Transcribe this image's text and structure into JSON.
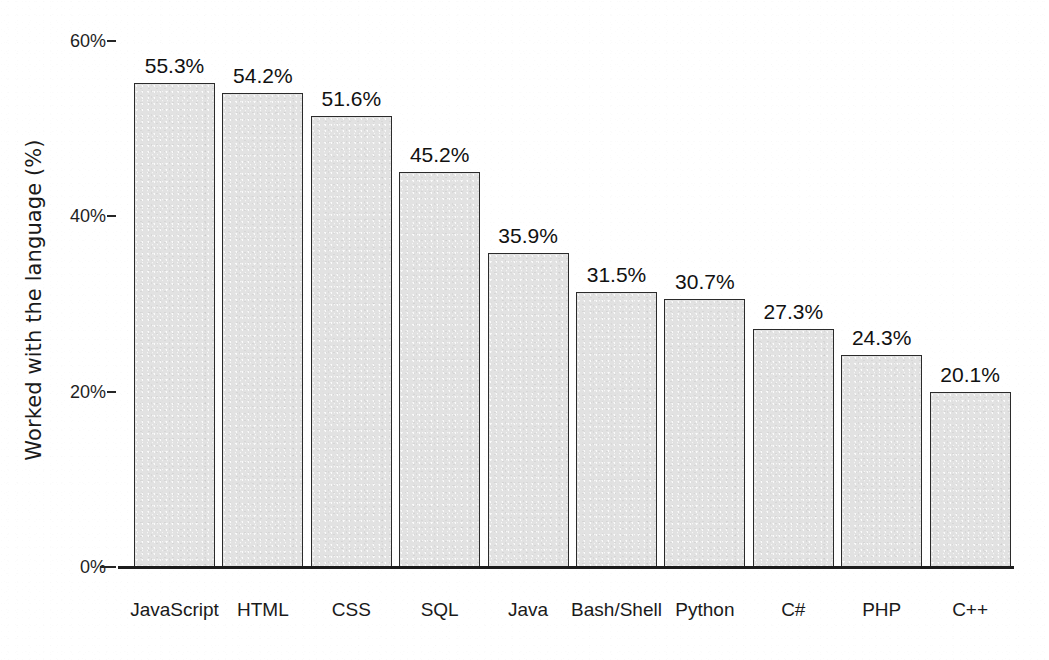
{
  "chart_data": {
    "type": "bar",
    "title": "",
    "xlabel": "",
    "ylabel": "Worked with the language (%)",
    "ylim": [
      0,
      60
    ],
    "grid": false,
    "legend": false,
    "orientation": "vertical",
    "categories": [
      "JavaScript",
      "HTML",
      "CSS",
      "SQL",
      "Java",
      "Bash/Shell",
      "Python",
      "C#",
      "PHP",
      "C++"
    ],
    "values": [
      55.3,
      54.2,
      51.6,
      45.2,
      35.9,
      31.5,
      30.7,
      27.3,
      24.3,
      20.1
    ],
    "value_labels": [
      "55.3%",
      "54.2%",
      "51.6%",
      "45.2%",
      "35.9%",
      "31.5%",
      "30.7%",
      "27.3%",
      "24.3%",
      "20.1%"
    ],
    "y_ticks": [
      0,
      20,
      40,
      60
    ],
    "y_tick_labels": [
      "0%",
      "20%",
      "40%",
      "60%"
    ],
    "bar_fill_color": "#e2e2e2",
    "bar_edge_color": "#2b2b2b",
    "axis_color": "#1c1c1c",
    "text_color": "#1a1a1a"
  }
}
